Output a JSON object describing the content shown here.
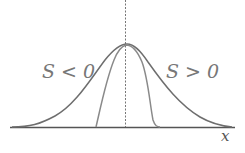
{
  "diagram": {
    "left_label": "S < 0",
    "right_label": "S > 0",
    "axis_label": "x",
    "colors": {
      "wide_curve": "#6e6e6e",
      "narrow_curve": "#8a8a8a",
      "axis": "#555555",
      "dashed": "#777777",
      "text": "#777777"
    }
  }
}
